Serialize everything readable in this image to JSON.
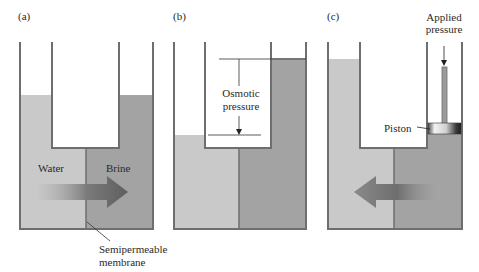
{
  "panels": [
    {
      "label": "(a)",
      "left_text": "Water",
      "right_text": "Brine",
      "membrane_text_line1": "Semipermeable",
      "membrane_text_line2": "membrane",
      "flow_direction": "right"
    },
    {
      "label": "(b)",
      "annotation_line1": "Osmotic",
      "annotation_line2": "pressure"
    },
    {
      "label": "(c)",
      "applied_line1": "Applied",
      "applied_line2": "pressure",
      "piston_text": "Piston",
      "flow_direction": "left"
    }
  ],
  "colors": {
    "water": "#c9c9c9",
    "brine": "#a3a3a3",
    "wall": "#6e6e6e",
    "arrow_dark": "#6a6a6a"
  }
}
